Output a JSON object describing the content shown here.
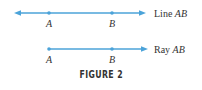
{
  "figure": {
    "caption": "FIGURE 2",
    "line_color": "#4ba3d9",
    "text_color": "#333333",
    "line": {
      "label_prefix": "Line ",
      "label_name": "AB",
      "point_a": "A",
      "point_b": "B"
    },
    "ray": {
      "label_prefix": "Ray ",
      "label_name": "AB",
      "point_a": "A",
      "point_b": "B"
    }
  }
}
